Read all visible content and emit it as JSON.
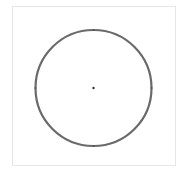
{
  "diagram": {
    "frame": {
      "x": 12,
      "y": 6,
      "width": 164,
      "height": 160,
      "border_color": "#e6e6e6"
    },
    "circle": {
      "cx": 93.5,
      "cy": 88,
      "r": 58,
      "stroke": "#6a6a6a",
      "stroke_width": 2.2
    },
    "center_point": {
      "cx": 93.5,
      "cy": 88,
      "r": 1.2,
      "fill": "#333333"
    },
    "anchor_points": [
      {
        "name": "top",
        "cx": 93.5,
        "cy": 30
      },
      {
        "name": "right",
        "cx": 151.5,
        "cy": 88
      },
      {
        "name": "bottom",
        "cx": 93.5,
        "cy": 146
      },
      {
        "name": "left",
        "cx": 35.5,
        "cy": 88
      }
    ]
  }
}
